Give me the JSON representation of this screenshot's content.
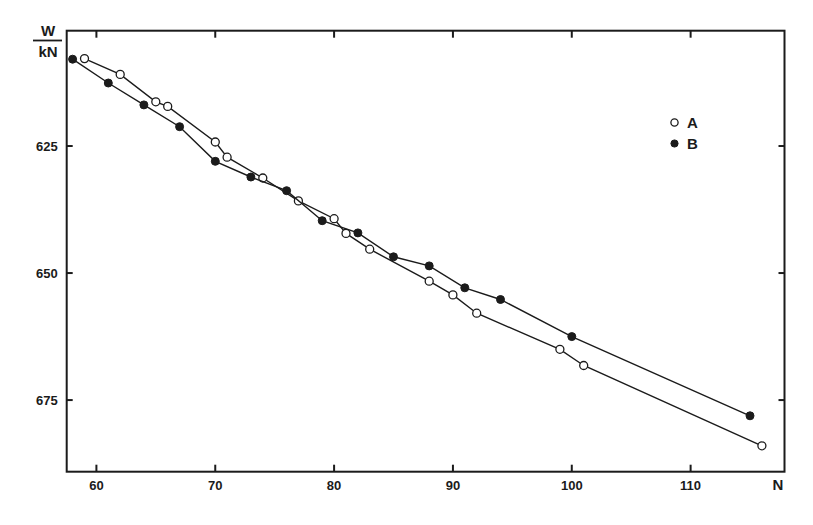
{
  "chart_data": {
    "type": "line",
    "title": "",
    "xlabel": "N",
    "ylabel": "W / kN",
    "ylabel_numerator": "W",
    "ylabel_denominator": "kN",
    "xlim": [
      57.5,
      117.9
    ],
    "ylim": [
      602.3,
      689.1
    ],
    "y_inverted": true,
    "grid": false,
    "x_ticks": [
      60,
      70,
      80,
      90,
      100,
      110
    ],
    "x_tick_labels": [
      "60",
      "70",
      "80",
      "90",
      "100",
      "110"
    ],
    "y_ticks": [
      625,
      650,
      675
    ],
    "y_tick_labels": [
      "625",
      "650",
      "675"
    ],
    "legend": {
      "position": "upper right (inside)",
      "entries": [
        {
          "label": "A",
          "marker": "open-circle"
        },
        {
          "label": "B",
          "marker": "filled-circle"
        }
      ]
    },
    "series": [
      {
        "name": "A",
        "marker": "open-circle",
        "x": [
          59,
          62,
          65,
          66,
          70,
          71,
          74,
          77,
          80,
          81,
          83,
          88,
          90,
          92,
          99,
          101,
          116
        ],
        "values": [
          607.8,
          610.9,
          616.3,
          617.2,
          624.2,
          627.2,
          631.3,
          635.8,
          639.3,
          642.2,
          645.3,
          651.6,
          654.3,
          657.9,
          665.0,
          668.2,
          684.0
        ]
      },
      {
        "name": "B",
        "marker": "filled-circle",
        "x": [
          58,
          61,
          64,
          67,
          70,
          73,
          76,
          79,
          82,
          85,
          88,
          91,
          94,
          100,
          115
        ],
        "values": [
          607.9,
          612.6,
          616.9,
          621.2,
          628.0,
          631.1,
          633.8,
          639.7,
          642.1,
          646.8,
          648.6,
          652.9,
          655.2,
          662.5,
          678.1
        ]
      }
    ]
  },
  "axes": {
    "x_label": "N",
    "y_label_top": "W",
    "y_label_bottom": "kN"
  },
  "legend": {
    "a_label": "A",
    "b_label": "B"
  },
  "colors": {
    "ink": "#1b1b1b",
    "background": "#ffffff"
  }
}
